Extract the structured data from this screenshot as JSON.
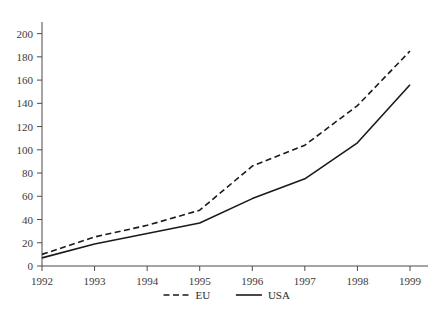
{
  "chart_data": {
    "type": "line",
    "title": "",
    "subtitle": "",
    "xlabel": "",
    "ylabel": "",
    "categories": [
      "1992",
      "1993",
      "1994",
      "1995",
      "1996",
      "1997",
      "1998",
      "1999"
    ],
    "x": [
      1992,
      1993,
      1994,
      1995,
      1996,
      1997,
      1998,
      1999
    ],
    "series": [
      {
        "name": "EU",
        "style": "dashed",
        "color": "#1a1a1a",
        "values": [
          10,
          25,
          35,
          48,
          86,
          104,
          138,
          185
        ]
      },
      {
        "name": "USA",
        "style": "solid",
        "color": "#1a1a1a",
        "values": [
          7,
          19,
          28,
          37,
          58,
          75,
          106,
          156
        ]
      }
    ],
    "ylim": [
      0,
      210
    ],
    "xlim": [
      1992,
      1999
    ],
    "yticks": [
      0,
      20,
      40,
      60,
      80,
      100,
      120,
      140,
      160,
      180,
      200
    ],
    "ytick_labels": [
      "0",
      "20",
      "40",
      "60",
      "80",
      "100",
      "120",
      "140",
      "160",
      "180",
      "200"
    ],
    "xticks": [
      1992,
      1993,
      1994,
      1995,
      1996,
      1997,
      1998,
      1999
    ],
    "xtick_labels": [
      "1992",
      "1993",
      "1994",
      "1995",
      "1996",
      "1997",
      "1998",
      "1999"
    ],
    "grid": false,
    "legend_position": "bottom-center",
    "legend": [
      {
        "label": "EU",
        "style": "dashed"
      },
      {
        "label": "USA",
        "style": "solid"
      }
    ]
  },
  "axis": {
    "line_color": "#4a4a4a",
    "tick_color": "#4a4a4a",
    "label_color": "#3a3a3a"
  },
  "background": "#ffffff"
}
